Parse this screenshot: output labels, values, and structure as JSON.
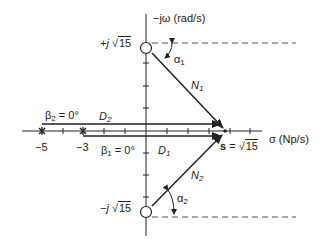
{
  "diagram": {
    "type": "pole-zero s-plane vector diagram",
    "axes": {
      "vertical_label": "−jω (rad/s)",
      "horizontal_label": "σ (Np/s)"
    },
    "zeros": [
      {
        "label": "+j √15",
        "prefix": "+j",
        "radicand": "15"
      },
      {
        "label": "−j √15",
        "prefix": "−j",
        "radicand": "15"
      }
    ],
    "poles": [
      {
        "label": "−5",
        "value": -5
      },
      {
        "label": "−3",
        "value": -3
      }
    ],
    "evaluation_point": {
      "label": "s = √15",
      "s": "s",
      "eq": "=",
      "radicand": "15"
    },
    "vectors": [
      {
        "name": "N",
        "sub": "1"
      },
      {
        "name": "N",
        "sub": "2"
      },
      {
        "name": "D",
        "sub": "1"
      },
      {
        "name": "D",
        "sub": "2"
      }
    ],
    "angles": [
      {
        "sym": "α",
        "sub": "1"
      },
      {
        "sym": "α",
        "sub": "2"
      },
      {
        "sym": "β",
        "sub": "1",
        "value": "= 0°"
      },
      {
        "sym": "β",
        "sub": "2",
        "value": "= 0°"
      }
    ],
    "colors": {
      "line": "#222222",
      "dashed": "#555555",
      "background": "#ffffff"
    }
  }
}
